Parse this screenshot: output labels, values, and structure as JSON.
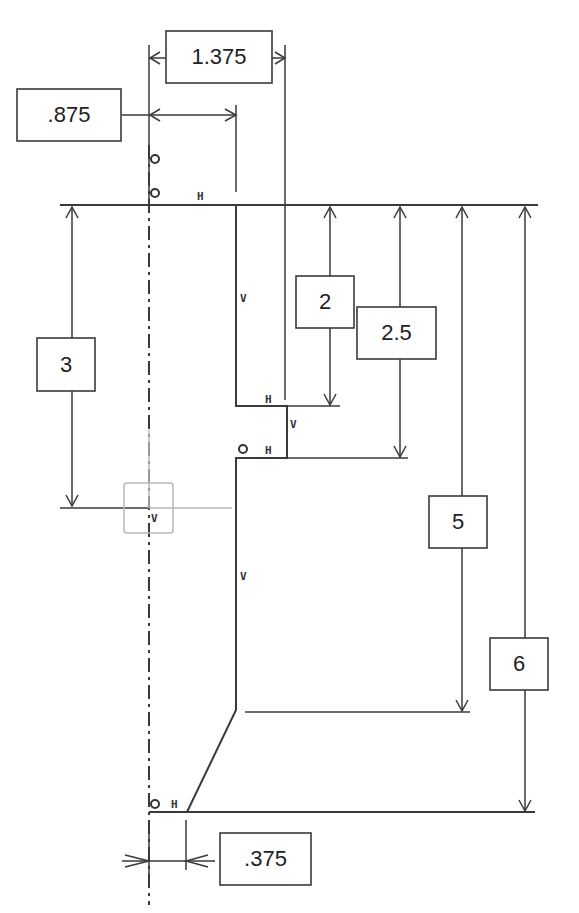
{
  "drawing": {
    "type": "constrained sketch with dimensions",
    "dimensions": [
      {
        "id": "dim-1375",
        "label": "1.375",
        "orientation": "horizontal"
      },
      {
        "id": "dim-875",
        "label": ".875",
        "orientation": "horizontal"
      },
      {
        "id": "dim-3",
        "label": "3",
        "orientation": "vertical"
      },
      {
        "id": "dim-2",
        "label": "2",
        "orientation": "vertical"
      },
      {
        "id": "dim-25",
        "label": "2.5",
        "orientation": "vertical"
      },
      {
        "id": "dim-5",
        "label": "5",
        "orientation": "vertical"
      },
      {
        "id": "dim-6",
        "label": "6",
        "orientation": "vertical"
      },
      {
        "id": "dim-375",
        "label": ".375",
        "orientation": "horizontal"
      }
    ],
    "constraint_tags": {
      "horizontal": "H",
      "vertical": "V"
    }
  }
}
